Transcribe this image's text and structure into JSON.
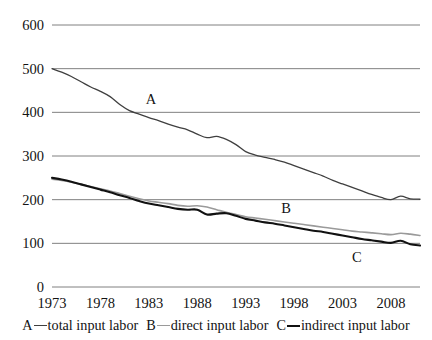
{
  "chart_data": {
    "type": "line",
    "title": "",
    "xlabel": "",
    "ylabel": "",
    "xlim": [
      1973,
      2011
    ],
    "ylim": [
      0,
      600
    ],
    "grid": true,
    "legend_position": "bottom",
    "xticks": [
      "1973",
      "1978",
      "1983",
      "1988",
      "1993",
      "1998",
      "2003",
      "2008"
    ],
    "xtick_values": [
      1973,
      1978,
      1983,
      1988,
      1993,
      1998,
      2003,
      2008
    ],
    "yticks": [
      "0",
      "100",
      "200",
      "300",
      "400",
      "500",
      "600"
    ],
    "ytick_values": [
      0,
      100,
      200,
      300,
      400,
      500,
      600
    ],
    "x": [
      1973,
      1974,
      1975,
      1976,
      1977,
      1978,
      1979,
      1980,
      1981,
      1982,
      1983,
      1984,
      1985,
      1986,
      1987,
      1988,
      1989,
      1990,
      1991,
      1992,
      1993,
      1994,
      1995,
      1996,
      1997,
      1998,
      1999,
      2000,
      2001,
      2002,
      2003,
      2004,
      2005,
      2006,
      2007,
      2008,
      2009,
      2010,
      2011
    ],
    "series": [
      {
        "name": "total input labor",
        "key": "A",
        "color": "#3f3f3f",
        "width": 1.3,
        "values": [
          500,
          492,
          482,
          470,
          458,
          448,
          436,
          418,
          404,
          396,
          388,
          381,
          373,
          366,
          360,
          350,
          342,
          345,
          338,
          326,
          310,
          302,
          297,
          292,
          286,
          278,
          270,
          262,
          254,
          244,
          236,
          228,
          220,
          212,
          205,
          200,
          208,
          202,
          201
        ]
      },
      {
        "name": "direct input labor",
        "key": "B",
        "color": "#9a9a9a",
        "width": 1.6,
        "values": [
          247,
          244,
          240,
          235,
          230,
          225,
          220,
          214,
          208,
          202,
          197,
          194,
          191,
          187,
          185,
          186,
          183,
          177,
          171,
          166,
          161,
          158,
          155,
          152,
          149,
          146,
          143,
          140,
          137,
          134,
          131,
          128,
          126,
          124,
          122,
          120,
          123,
          121,
          118
        ]
      },
      {
        "name": "indirect input labor",
        "key": "C",
        "color": "#111111",
        "width": 2.1,
        "values": [
          250,
          246,
          241,
          235,
          229,
          223,
          217,
          210,
          204,
          197,
          191,
          187,
          183,
          179,
          177,
          177,
          166,
          168,
          169,
          163,
          156,
          152,
          148,
          145,
          141,
          137,
          133,
          129,
          126,
          122,
          118,
          114,
          110,
          107,
          104,
          101,
          106,
          98,
          95
        ]
      }
    ],
    "annotations": [
      {
        "text": "A",
        "x": 1983.2,
        "y": 430
      },
      {
        "text": "B",
        "x": 1997.2,
        "y": 180
      },
      {
        "text": "C",
        "x": 2004.5,
        "y": 68
      }
    ]
  },
  "legend": {
    "entries": [
      {
        "key": "A",
        "label": "total input labor"
      },
      {
        "key": "B",
        "label": "direct input labor"
      },
      {
        "key": "C",
        "label": "indirect input labor"
      }
    ]
  }
}
